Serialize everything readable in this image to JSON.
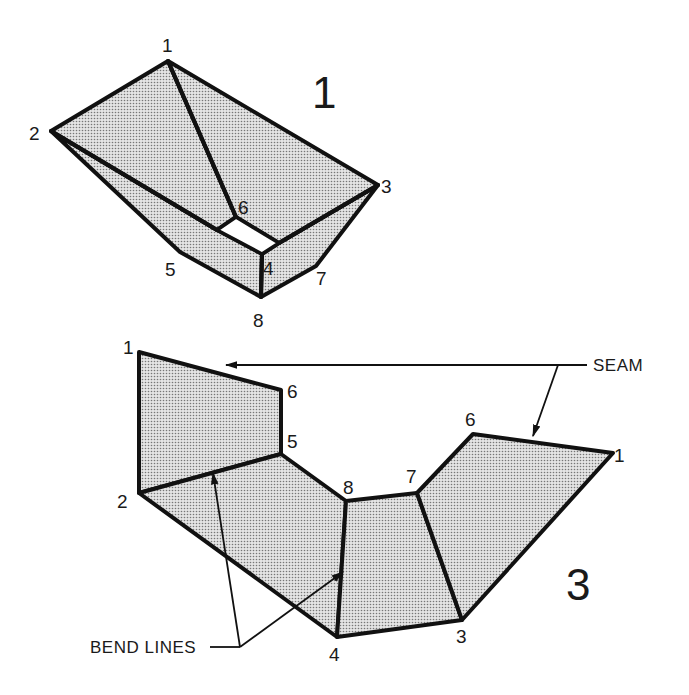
{
  "figure_top": {
    "label": "1",
    "vertices": {
      "v1": "1",
      "v2": "2",
      "v3": "3",
      "v4": "4",
      "v5": "5",
      "v6": "6",
      "v7": "7",
      "v8": "8"
    }
  },
  "figure_bottom": {
    "label": "3",
    "vertices": {
      "v1_left": "1",
      "v6_left": "6",
      "v5": "5",
      "v2": "2",
      "v8": "8",
      "v7": "7",
      "v6_right": "6",
      "v1_right": "1",
      "v4": "4",
      "v3": "3"
    },
    "callouts": {
      "seam": "SEAM",
      "bend_lines": "BEND LINES"
    }
  },
  "colors": {
    "ink": "#111111",
    "background": "#ffffff",
    "shading": "#9a9a9a"
  }
}
